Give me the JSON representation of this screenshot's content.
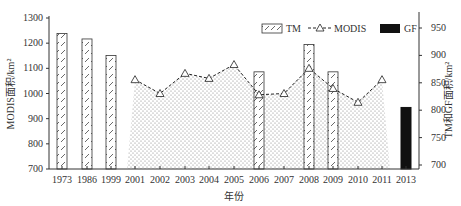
{
  "chart_data": {
    "type": "bar+line",
    "title": "",
    "xlabel": "年份",
    "ylabel_left": "MODIS面积/km²",
    "ylabel_right": "TM和GF面积/km²",
    "ylim_left": [
      700,
      1300
    ],
    "yticks_left": [
      700,
      800,
      900,
      1000,
      1100,
      1200,
      1300
    ],
    "ylim_right": [
      700,
      975
    ],
    "yticks_right": [
      700,
      750,
      800,
      850,
      900,
      950
    ],
    "categories": [
      "1973",
      "1986",
      "1999",
      "2001",
      "2002",
      "2003",
      "2004",
      "2005",
      "2006",
      "2007",
      "2008",
      "2009",
      "2010",
      "2011",
      "2013"
    ],
    "legend": [
      {
        "name": "TM",
        "style": "hatched-bar"
      },
      {
        "name": "MODIS",
        "style": "dashed-line-triangle-marker"
      },
      {
        "name": "GF",
        "style": "solid-black-bar"
      }
    ],
    "legend_position": "top-right",
    "grid": false,
    "series": [
      {
        "name": "TM",
        "axis": "right",
        "type": "bar",
        "values": [
          940,
          930,
          900,
          null,
          null,
          null,
          null,
          null,
          870,
          null,
          920,
          870,
          null,
          null,
          null
        ]
      },
      {
        "name": "MODIS",
        "axis": "left",
        "type": "line-area",
        "values": [
          null,
          null,
          null,
          1055,
          1000,
          1080,
          1060,
          1115,
          995,
          1000,
          1100,
          1020,
          965,
          1055,
          null
        ]
      },
      {
        "name": "GF",
        "axis": "right",
        "type": "bar",
        "values": [
          null,
          null,
          null,
          null,
          null,
          null,
          null,
          null,
          null,
          null,
          null,
          null,
          null,
          null,
          805
        ]
      }
    ]
  }
}
